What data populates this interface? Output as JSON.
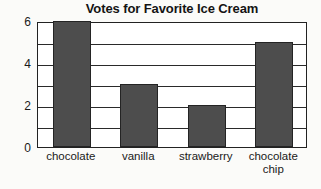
{
  "chart_data": {
    "type": "bar",
    "title": "Votes for Favorite Ice Cream",
    "xlabel": "",
    "ylabel": "",
    "categories": [
      "chocolate",
      "vanilla",
      "strawberry",
      "chocolate chip"
    ],
    "values": [
      6,
      3,
      2,
      5
    ],
    "ylim": [
      0,
      6
    ],
    "ytick_labels": [
      "0",
      "2",
      "4",
      "6"
    ],
    "ytick_values": [
      0,
      2,
      4,
      6
    ],
    "gridlines_at": [
      1,
      2,
      3,
      4,
      5,
      6
    ],
    "grid": true,
    "legend": false,
    "bar_color": "#4d4d4d",
    "bar_edge_color": "#242424",
    "axis_color": "#222222",
    "plot_background": "#ffffff",
    "page_background": "#fbfbf9"
  }
}
